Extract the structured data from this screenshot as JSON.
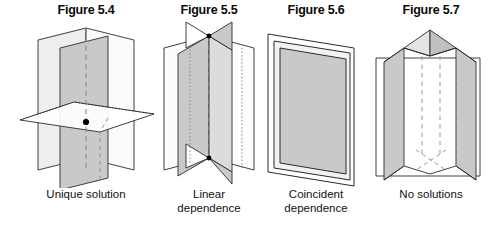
{
  "document": {
    "kind": "textbook-figure-strip",
    "background_color": "#ffffff",
    "line_color": "#2b2b2b",
    "plane_fill": "#c9c9c9",
    "plane_fill_light": "#e2e2e2",
    "plane_fill_white": "#ffffff",
    "point_color": "#000000"
  },
  "figures": [
    {
      "id": "figure-5-4",
      "title": "Figure 5.4",
      "caption": "Unique solution",
      "scene": "three planes meeting in a single point",
      "plane_count": 3,
      "intersection_point_visible": true
    },
    {
      "id": "figure-5-5",
      "title": "Figure 5.5",
      "caption": "Linear\ndependence",
      "scene": "three planes meeting along a common line",
      "plane_count": 3,
      "intersection_point_visible": false
    },
    {
      "id": "figure-5-6",
      "title": "Figure 5.6",
      "caption": "Coincident\ndependence",
      "scene": "three coincident overlapping planes",
      "plane_count": 3,
      "intersection_point_visible": false
    },
    {
      "id": "figure-5-7",
      "title": "Figure 5.7",
      "caption": "No solutions",
      "scene": "three planes with no common intersection",
      "plane_count": 3,
      "intersection_point_visible": false
    }
  ]
}
